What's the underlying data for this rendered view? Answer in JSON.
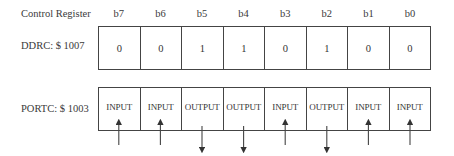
{
  "header": {
    "title": "Control Register",
    "bits": [
      "b7",
      "b6",
      "b5",
      "b4",
      "b3",
      "b2",
      "b1",
      "b0"
    ]
  },
  "ddrc": {
    "label": "DDRC: $ 1007",
    "values": [
      "0",
      "0",
      "1",
      "1",
      "0",
      "1",
      "0",
      "0"
    ]
  },
  "portc": {
    "label": "PORTC: $ 1003",
    "values": [
      "INPUT",
      "INPUT",
      "OUTPUT",
      "OUTPUT",
      "INPUT",
      "OUTPUT",
      "INPUT",
      "INPUT"
    ],
    "arrows": [
      "up",
      "up",
      "down",
      "down",
      "up",
      "down",
      "up",
      "up"
    ]
  },
  "colors": {
    "line": "#444444",
    "text": "#3a3a3a"
  }
}
